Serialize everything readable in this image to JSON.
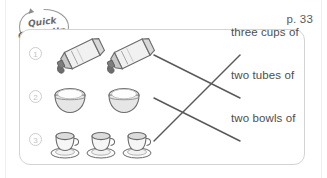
{
  "worksheet": {
    "page_number": "p. 33",
    "badge": {
      "line1": "Quick",
      "line2": "Check-Up",
      "icon": "circular-arrow-icon"
    },
    "rows": [
      {
        "number": "1",
        "object": "tube",
        "object_count": 2,
        "object_icon": "paint-tube-icon"
      },
      {
        "number": "2",
        "object": "bowl",
        "object_count": 2,
        "object_icon": "rice-bowl-icon"
      },
      {
        "number": "3",
        "object": "cup",
        "object_count": 3,
        "object_icon": "teacup-saucer-icon"
      }
    ],
    "labels": [
      {
        "text": "three cups of"
      },
      {
        "text": "two tubes of"
      },
      {
        "text": "two bowls of"
      }
    ],
    "matches": [
      {
        "from_row": 1,
        "to_label": 2
      },
      {
        "from_row": 2,
        "to_label": 3
      },
      {
        "from_row": 3,
        "to_label": 1
      }
    ],
    "colors": {
      "card_border": "#d3d3d3",
      "line": "#5a5a5a",
      "text": "#4e4e4e",
      "number_circle": "#cdcdcd",
      "illustration_outline": "#6b6b6b",
      "illustration_fill": "#e8e8e8"
    }
  }
}
